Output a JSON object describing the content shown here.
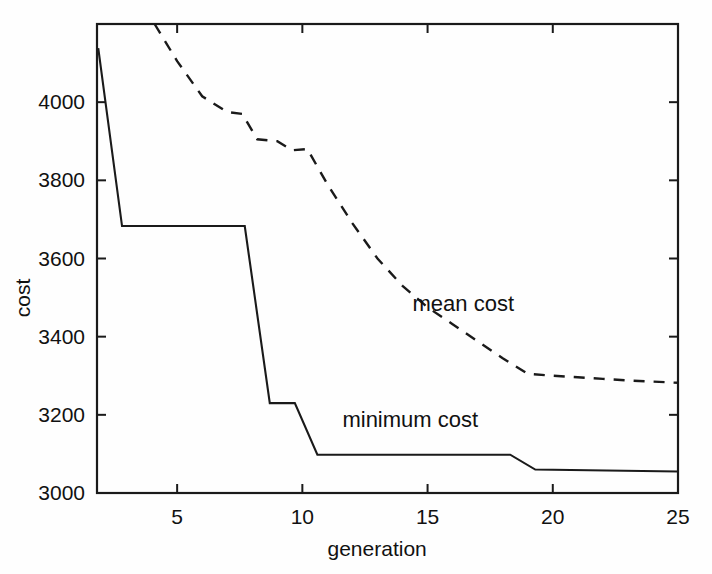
{
  "chart_data": {
    "type": "line",
    "title": "",
    "xlabel": "generation",
    "ylabel": "cost",
    "xlim": [
      1.8,
      25
    ],
    "ylim": [
      3000,
      4200
    ],
    "grid": false,
    "legend": "inline-annotations",
    "x_ticks": [
      5,
      10,
      15,
      20,
      25
    ],
    "x_tick_labels": [
      "5",
      "10",
      "15",
      "20",
      "25"
    ],
    "y_ticks": [
      3000,
      3200,
      3400,
      3600,
      3800,
      4000
    ],
    "y_tick_labels": [
      "3000",
      "3200",
      "3400",
      "3600",
      "3800",
      "4000"
    ],
    "annotations": [
      {
        "text": "mean cost",
        "x": 14.4,
        "y": 3480
      },
      {
        "text": "minimum cost",
        "x": 11.6,
        "y": 3185
      }
    ],
    "series": [
      {
        "name": "minimum cost",
        "style": "solid",
        "x": [
          1.85,
          2.8,
          7.7,
          8.7,
          9.7,
          10.6,
          18.3,
          19.3,
          25.0
        ],
        "values": [
          4138,
          3683,
          3683,
          3230,
          3230,
          3098,
          3098,
          3060,
          3055
        ]
      },
      {
        "name": "mean cost",
        "style": "dashed",
        "x": [
          4.1,
          5.0,
          6.0,
          7.0,
          7.6,
          8.2,
          9.0,
          9.6,
          10.2,
          11.0,
          12.0,
          13.0,
          14.0,
          15.0,
          16.0,
          17.0,
          18.0,
          19.0,
          20.0,
          21.0,
          22.0,
          23.0,
          24.0,
          25.0
        ],
        "values": [
          4200,
          4105,
          4015,
          3975,
          3970,
          3905,
          3900,
          3877,
          3880,
          3790,
          3690,
          3600,
          3530,
          3475,
          3432,
          3388,
          3345,
          3305,
          3300,
          3296,
          3292,
          3288,
          3285,
          3282
        ]
      }
    ]
  },
  "axes": {
    "x_title": "generation",
    "y_title": "cost"
  }
}
